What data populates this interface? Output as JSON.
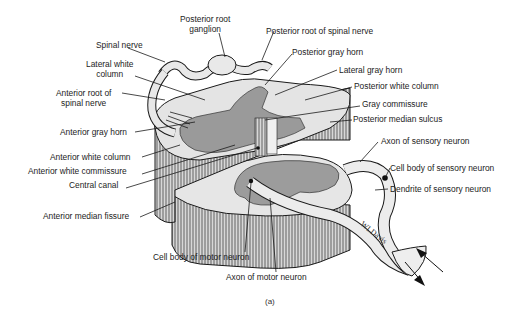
{
  "figure": {
    "caption": "(a)",
    "artist_signature": "WLDavis"
  },
  "labels": {
    "posterior_root_ganglion_1": "Posterior root",
    "posterior_root_ganglion_2": "ganglion",
    "spinal_nerve": "Spinal nerve",
    "lateral_white_column_1": "Lateral white",
    "lateral_white_column_2": "column",
    "anterior_root_1": "Anterior root of",
    "anterior_root_2": "spinal nerve",
    "anterior_gray_horn": "Anterior gray horn",
    "anterior_white_column": "Anterior white column",
    "anterior_white_commissure": "Anterior white commissure",
    "central_canal": "Central canal",
    "anterior_median_fissure": "Anterior median fissure",
    "posterior_root_of_spinal_nerve": "Posterior root of spinal nerve",
    "posterior_gray_horn": "Posterior gray horn",
    "lateral_gray_horn": "Lateral gray horn",
    "posterior_white_column": "Posterior white column",
    "gray_commissure": "Gray commissure",
    "posterior_median_sulcus": "Posterior median sulcus",
    "axon_of_sensory_neuron": "Axon of sensory neuron",
    "cell_body_of_sensory_neuron": "Cell body of sensory neuron",
    "dendrite_of_sensory_neuron": "Dendrite of sensory neuron",
    "cell_body_of_motor_neuron": "Cell body of motor neuron",
    "axon_of_motor_neuron": "Axon of motor neuron"
  },
  "colors": {
    "white_matter": "#e4e4e4",
    "gray_matter": "#9a9a9a",
    "outline": "#1a1a1a",
    "background": "#ffffff"
  }
}
